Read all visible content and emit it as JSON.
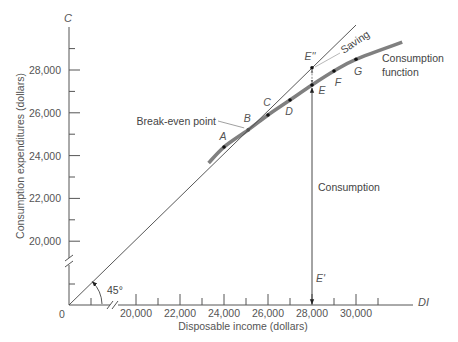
{
  "chart_data": {
    "type": "line",
    "title": "",
    "xlabel": "Disposable income (dollars)",
    "ylabel": "Consumption expenditures (dollars)",
    "x_axis_symbol": "DI",
    "y_axis_symbol": "C",
    "origin_label": "0",
    "grid": false,
    "axis_breaks": {
      "x": true,
      "y": true
    },
    "xlim": [
      20000,
      31000
    ],
    "ylim": [
      20000,
      29000
    ],
    "x_ticks": [
      20000,
      22000,
      24000,
      26000,
      28000,
      30000
    ],
    "x_tick_labels": [
      "20,000",
      "22,000",
      "24,000",
      "26,000",
      "28,000",
      "30,000"
    ],
    "x_minor_ticks": [
      21000,
      23000,
      25000,
      27000,
      29000,
      31000
    ],
    "y_ticks": [
      20000,
      22000,
      24000,
      26000,
      28000
    ],
    "y_tick_labels": [
      "20,000",
      "22,000",
      "24,000",
      "26,000",
      "28,000"
    ],
    "y_minor_ticks": [
      21000,
      23000,
      25000,
      27000,
      29000
    ],
    "series": [
      {
        "name": "Consumption function",
        "kind": "curve",
        "color": "#808080",
        "x": [
          23300,
          24000,
          25100,
          26000,
          27000,
          28000,
          29000,
          30000,
          32100
        ],
        "y": [
          23650,
          24400,
          25200,
          25900,
          26600,
          27300,
          27950,
          28500,
          29300
        ]
      },
      {
        "name": "45° line",
        "kind": "line",
        "color": "#444444",
        "x": [
          0,
          30000
        ],
        "y": [
          0,
          30100
        ]
      }
    ],
    "points": [
      {
        "label": "A",
        "x": 24000,
        "y": 24400
      },
      {
        "label": "B",
        "x": 25100,
        "y": 25200
      },
      {
        "label": "C",
        "x": 26000,
        "y": 25900
      },
      {
        "label": "D",
        "x": 27000,
        "y": 26600
      },
      {
        "label": "E",
        "x": 28000,
        "y": 27300
      },
      {
        "label": "F",
        "x": 29000,
        "y": 27950
      },
      {
        "label": "G",
        "x": 30000,
        "y": 28500
      },
      {
        "label": "E''",
        "x": 28000,
        "y": 28100
      }
    ],
    "annotations": {
      "break_even": "Break-even point",
      "saving": "Saving",
      "consumption": "Consumption",
      "e_prime": "E'",
      "angle": "45°",
      "consumption_function_line1": "Consumption",
      "consumption_function_line2": "function"
    }
  }
}
